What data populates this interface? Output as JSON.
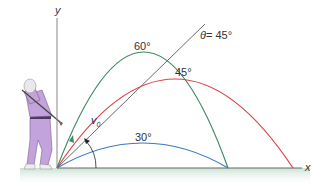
{
  "diagram": {
    "axes": {
      "x_label": "x",
      "y_label": "y"
    },
    "angle_marker": {
      "label": "θ = 45°",
      "theta_symbol": "θ",
      "value": "= 45°"
    },
    "velocity_label": "v",
    "velocity_subscript": "0",
    "trajectories": [
      {
        "angle": 60,
        "label": "60°",
        "color": "#3e8a62"
      },
      {
        "angle": 45,
        "label": "45°",
        "color": "#e0404a"
      },
      {
        "angle": 30,
        "label": "30°",
        "color": "#3a78c8"
      }
    ],
    "colors": {
      "axis": "#555555",
      "ground": "#cfe5d8",
      "golfer_outfit": "#c3a3dc",
      "reference_line": "#444444"
    }
  }
}
